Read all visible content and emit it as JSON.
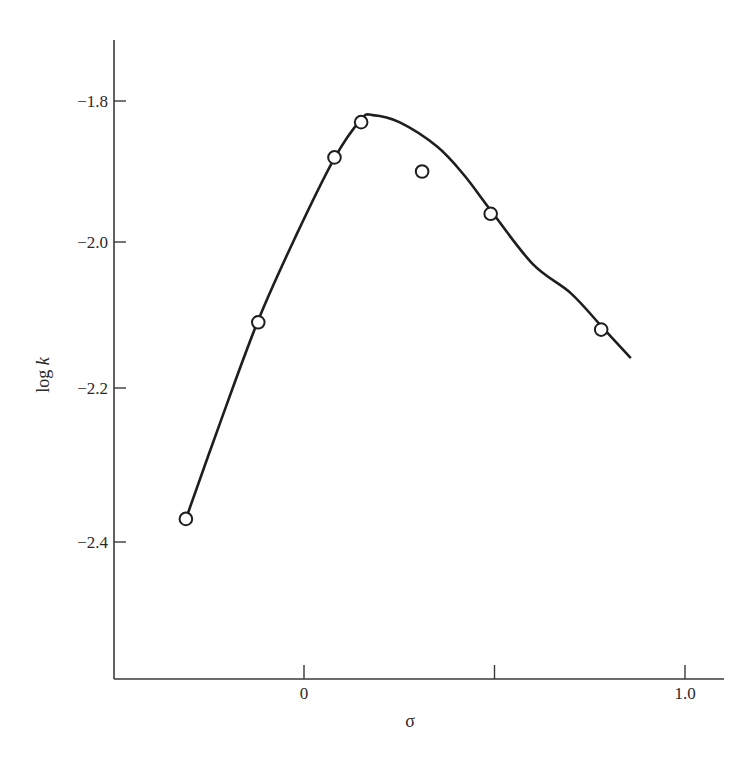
{
  "chart_data": {
    "type": "scatter",
    "title": "",
    "xlabel": "σ",
    "ylabel": "log k",
    "ylabel_parts": {
      "plain": "log ",
      "italic": "k"
    },
    "xlim": [
      -0.5,
      1.1
    ],
    "ylim": [
      -2.6,
      -1.73
    ],
    "grid": false,
    "legend": null,
    "x_ticks": [
      {
        "value": 0,
        "label": "0"
      },
      {
        "value": 0.5,
        "label": ""
      },
      {
        "value": 1.0,
        "label": "1.0"
      }
    ],
    "y_ticks": [
      {
        "value": -1.8,
        "label": "−1.8"
      },
      {
        "value": -2.0,
        "label": "−2.0"
      },
      {
        "value": -2.2,
        "label": "−2.2"
      },
      {
        "value": -2.4,
        "label": "−2.4"
      }
    ],
    "series": [
      {
        "name": "observed",
        "marker": "open-circle",
        "points": [
          {
            "x": -0.31,
            "y": -2.37
          },
          {
            "x": -0.12,
            "y": -2.11
          },
          {
            "x": 0.08,
            "y": -1.88
          },
          {
            "x": 0.15,
            "y": -1.83
          },
          {
            "x": 0.31,
            "y": -1.9
          },
          {
            "x": 0.49,
            "y": -1.96
          },
          {
            "x": 0.78,
            "y": -2.12
          }
        ]
      },
      {
        "name": "fitted curve",
        "marker": "line",
        "points": [
          {
            "x": -0.31,
            "y": -2.37
          },
          {
            "x": -0.22,
            "y": -2.245
          },
          {
            "x": -0.12,
            "y": -2.107
          },
          {
            "x": -0.02,
            "y": -1.99
          },
          {
            "x": 0.08,
            "y": -1.881
          },
          {
            "x": 0.15,
            "y": -1.826
          },
          {
            "x": 0.18,
            "y": -1.82
          },
          {
            "x": 0.25,
            "y": -1.83
          },
          {
            "x": 0.35,
            "y": -1.865
          },
          {
            "x": 0.42,
            "y": -1.905
          },
          {
            "x": 0.49,
            "y": -1.955
          },
          {
            "x": 0.6,
            "y": -2.03
          },
          {
            "x": 0.7,
            "y": -2.07
          },
          {
            "x": 0.78,
            "y": -2.115
          },
          {
            "x": 0.856,
            "y": -2.158
          }
        ]
      }
    ]
  },
  "layout": {
    "axis_color": "#3a3a3a",
    "line_color": "#1e1e1e"
  }
}
